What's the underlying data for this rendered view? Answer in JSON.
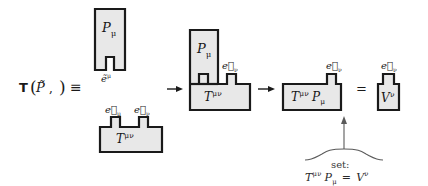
{
  "figure": {
    "type": "tensor-slot-diagram",
    "background": "#ffffff",
    "shape_fill": "#e8e8e8",
    "shape_stroke": "#1a1a1a",
    "text_color": "#1a1a1a"
  },
  "lhs": {
    "functional": "T",
    "open_paren": "(",
    "arg1": "P̃",
    "comma": ",",
    "close_paren": ")",
    "equiv": "≡"
  },
  "groups": [
    {
      "id": "group-1",
      "name": "covector-and-tensor",
      "blocks": [
        {
          "name": "p-covector-block",
          "label": "P",
          "index": "μ",
          "slot": "down"
        },
        {
          "name": "tensor-block",
          "label": "T",
          "index": "μν",
          "slot": "up"
        }
      ],
      "basis_labels": [
        {
          "name": "basis-covector-e-mu",
          "text": "ẽ",
          "index": "μ",
          "kind": "tilde-up"
        },
        {
          "name": "basis-vector-e-mu",
          "text": "e⃗",
          "index": "μ",
          "kind": "vector-down"
        },
        {
          "name": "basis-vector-e-nu",
          "text": "e⃗",
          "index": "ν",
          "kind": "vector-down"
        }
      ]
    },
    {
      "id": "group-2",
      "name": "plugged-tensor",
      "blocks": [
        {
          "name": "p-covector-block",
          "label": "P",
          "index": "μ"
        },
        {
          "name": "tensor-block",
          "label": "T",
          "index": "μν"
        }
      ],
      "basis_labels": [
        {
          "name": "basis-vector-e-nu",
          "text": "e⃗",
          "index": "ν"
        }
      ]
    },
    {
      "id": "group-3",
      "name": "contracted-tensor",
      "blocks": [
        {
          "name": "contracted-block",
          "label_left": "T",
          "index_left": "μν",
          "label_right": "P",
          "index_right": "μ"
        }
      ],
      "basis_labels": [
        {
          "name": "basis-vector-e-nu",
          "text": "e⃗",
          "index": "ν"
        }
      ]
    },
    {
      "id": "group-4",
      "name": "result-vector",
      "blocks": [
        {
          "name": "vector-block",
          "label": "V",
          "index": "ν"
        }
      ],
      "basis_labels": [
        {
          "name": "basis-vector-e-nu",
          "text": "e⃗",
          "index": "ν"
        }
      ]
    }
  ],
  "connectors": {
    "arrow1": "→",
    "arrow2": "→",
    "equals": "="
  },
  "annotation": {
    "caption": "set:",
    "equation_lhs_t": "T",
    "equation_lhs_t_index": "μν",
    "equation_lhs_p": "P",
    "equation_lhs_p_index": "μ",
    "equation_equals": "=",
    "equation_rhs": "V",
    "equation_rhs_index": "ν"
  }
}
